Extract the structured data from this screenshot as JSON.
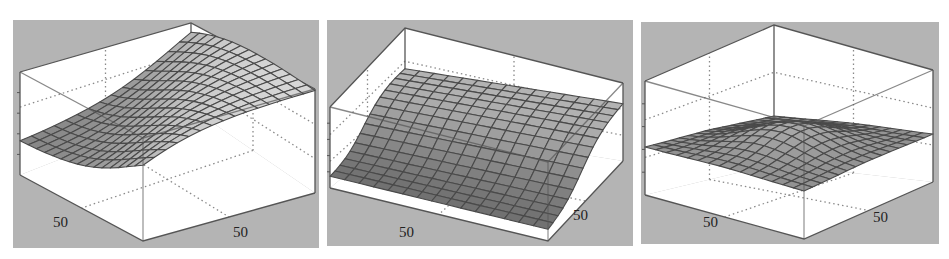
{
  "figure": {
    "background": "#ffffff",
    "panel_bg": "#b4b4b4",
    "pane_fill": "#ffffff",
    "box_stroke": "#555555",
    "grid_stroke": "#8a8a8a",
    "mesh_stroke": "#4a4a4a"
  },
  "chart_data": [
    {
      "type": "surface3d",
      "title": "",
      "panel_id": "left",
      "xlabel": "",
      "ylabel": "",
      "zlabel": "",
      "x_tick_labels": [
        "50"
      ],
      "y_tick_labels": [
        "50"
      ],
      "z_tick_labels": [],
      "grid": true,
      "mesh_resolution": 15,
      "description": "Sigmoidal ridge rising from a low flat plateau in the near-left/near-front corner to a high plateau at the back; surface rises strongly along one diagonal.",
      "z_range": [
        0,
        1
      ],
      "surface_model": {
        "kind": "ridge",
        "low": 0.32,
        "high": 1.0,
        "center": 0.55,
        "steepness": 9,
        "axis": "x+y"
      }
    },
    {
      "type": "surface3d",
      "title": "",
      "panel_id": "middle",
      "xlabel": "",
      "ylabel": "",
      "zlabel": "",
      "x_tick_labels": [
        "50"
      ],
      "y_tick_labels": [
        "50"
      ],
      "z_tick_labels": [],
      "grid": true,
      "mesh_resolution": 15,
      "description": "Sloping sheet high on the left edge descending smoothly to a low flat region on the right/front.",
      "z_range": [
        0,
        1
      ],
      "surface_model": {
        "kind": "slope",
        "low": 0.12,
        "high": 0.72,
        "center": 0.45,
        "steepness": 7,
        "axis": "x"
      }
    },
    {
      "type": "surface3d",
      "title": "",
      "panel_id": "right",
      "xlabel": "",
      "ylabel": "",
      "zlabel": "",
      "x_tick_labels": [
        "50"
      ],
      "y_tick_labels": [
        "50"
      ],
      "z_tick_labels": [],
      "grid": true,
      "mesh_resolution": 15,
      "description": "Mostly flat mid-height sheet with a gentle central bump.",
      "z_range": [
        0,
        1
      ],
      "surface_model": {
        "kind": "bump",
        "low": 0.42,
        "high": 0.62,
        "center": 0.5,
        "steepness": 0.22,
        "axis": "xy"
      }
    }
  ],
  "panels": [
    {
      "x": 13,
      "y": 20,
      "w": 306,
      "h": 228,
      "box": {
        "back_top": [
          178,
          3
        ],
        "left_top": [
          7,
          52
        ],
        "right_top": [
          302,
          69
        ],
        "front_top": [
          130,
          118
        ],
        "back_bot": [
          178,
          88
        ],
        "left_bot": [
          7,
          155
        ],
        "right_bot": [
          302,
          173
        ],
        "front_bot": [
          130,
          221
        ]
      },
      "labels": [
        {
          "text": "50",
          "x": 40,
          "y": 207
        },
        {
          "text": "50",
          "x": 220,
          "y": 217
        }
      ]
    },
    {
      "x": 327,
      "y": 20,
      "w": 306,
      "h": 226,
      "box": {
        "back_top": [
          78,
          8
        ],
        "left_top": [
          3,
          87
        ],
        "right_top": [
          296,
          63
        ],
        "front_top": [
          221,
          142
        ],
        "back_bot": [
          78,
          106
        ],
        "left_bot": [
          3,
          168
        ],
        "right_bot": [
          296,
          141
        ],
        "front_bot": [
          221,
          221
        ]
      },
      "labels": [
        {
          "text": "50",
          "x": 72,
          "y": 217
        },
        {
          "text": "50",
          "x": 246,
          "y": 200
        }
      ]
    },
    {
      "x": 641,
      "y": 22,
      "w": 298,
      "h": 222,
      "box": {
        "back_top": [
          133,
          3
        ],
        "left_top": [
          4,
          59
        ],
        "right_top": [
          292,
          48
        ],
        "front_top": [
          163,
          104
        ],
        "back_bot": [
          133,
          142
        ],
        "left_bot": [
          4,
          173
        ],
        "right_bot": [
          292,
          160
        ],
        "front_bot": [
          163,
          217
        ]
      },
      "labels": [
        {
          "text": "50",
          "x": 62,
          "y": 205
        },
        {
          "text": "50",
          "x": 232,
          "y": 200
        }
      ]
    }
  ]
}
